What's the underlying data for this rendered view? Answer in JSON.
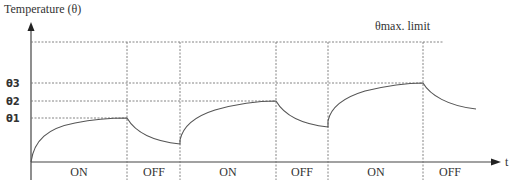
{
  "diagram": {
    "title": "Temperature (θ)",
    "y_axis_label": "Temperature (θ)",
    "x_axis_label": "t",
    "max_limit_label": "θmax. limit",
    "levels": [
      {
        "label": "θ3",
        "y": 83
      },
      {
        "label": "θ2",
        "y": 101
      },
      {
        "label": "θ1",
        "y": 118
      }
    ],
    "phases": [
      {
        "label": "ON",
        "x_center": 79
      },
      {
        "label": "OFF",
        "x_center": 154
      },
      {
        "label": "ON",
        "x_center": 228
      },
      {
        "label": "OFF",
        "x_center": 302
      },
      {
        "label": "ON",
        "x_center": 376
      },
      {
        "label": "OFF",
        "x_center": 450
      }
    ],
    "colors": {
      "axis": "#444444",
      "curve": "#555555",
      "dash": "#777777",
      "text": "#333333"
    }
  }
}
